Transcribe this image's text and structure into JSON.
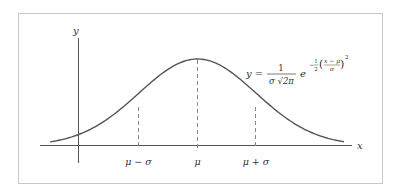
{
  "figure": {
    "type": "normal-distribution-curve",
    "axis_labels": {
      "x": "x",
      "y": "y"
    },
    "tick_labels": {
      "mu_minus_sigma": "μ − σ",
      "mu": "μ",
      "mu_plus_sigma": "μ + σ"
    },
    "formula": {
      "lhs": "y =",
      "numerator": "1",
      "denominator": "σ √2π",
      "base": "e",
      "exponent_coef_num": "1",
      "exponent_coef_den": "2",
      "exponent_neg": "−",
      "exponent_frac_num": "x − μ",
      "exponent_frac_den": "σ",
      "exponent_power": "2"
    },
    "colors": {
      "frame": "#c8c8c8",
      "curve": "#555555",
      "axis": "#555555",
      "dashed": "#888888"
    }
  },
  "chart_data": {
    "type": "line",
    "title": "",
    "xlabel": "x",
    "ylabel": "y",
    "series": [
      {
        "name": "normal density",
        "function": "y = 1/(σ√(2π)) · e^(−½((x−μ)/σ)²)"
      }
    ],
    "markers": [
      "μ − σ",
      "μ",
      "μ + σ"
    ],
    "grid": false
  }
}
